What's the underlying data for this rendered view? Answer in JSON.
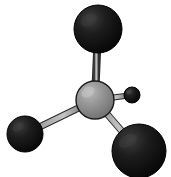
{
  "figure": {
    "kind": "molecule-diagram",
    "width": 171,
    "height": 177,
    "background_color": "#ffffff"
  },
  "palette": {
    "central_atom_fill": "#8c8c8c",
    "central_atom_highlight": "#b4b4b4",
    "central_atom_shadow": "#6e6e6e",
    "central_atom_outline": "#1a1a1a",
    "dark_atom_fill": "#141414",
    "dark_atom_highlight": "#3a3a3a",
    "dark_atom_outline": "#000000",
    "bond_fill": "#9a9a9a",
    "bond_outline": "#2b2b2b"
  },
  "atoms": [
    {
      "id": "atom-center",
      "label": "central-atom",
      "color_name": "gray",
      "cx": 95,
      "cy": 100,
      "r": 19
    },
    {
      "id": "atom-top",
      "label": "upper-atom",
      "color_name": "black",
      "cx": 98,
      "cy": 29,
      "r": 24
    },
    {
      "id": "atom-lower-left",
      "label": "lower-left-atom",
      "color_name": "black",
      "cx": 25,
      "cy": 134,
      "r": 18
    },
    {
      "id": "atom-lower-right",
      "label": "lower-right-atom",
      "color_name": "black",
      "cx": 139,
      "cy": 151,
      "r": 27
    },
    {
      "id": "atom-right-small",
      "label": "right-small-atom",
      "color_name": "black",
      "cx": 132,
      "cy": 95,
      "r": 8
    }
  ],
  "bonds": [
    {
      "id": "bond-center-top",
      "label": "bond-center-to-upper-atom",
      "from": "atom-center",
      "to": "atom-top",
      "width": 6
    },
    {
      "id": "bond-center-lower-left",
      "label": "bond-center-to-lower-left-atom",
      "from": "atom-center",
      "to": "atom-lower-left",
      "width": 6
    },
    {
      "id": "bond-center-lower-right",
      "label": "bond-center-to-lower-right-atom",
      "from": "atom-center",
      "to": "atom-lower-right",
      "width": 6
    },
    {
      "id": "bond-center-right-small",
      "label": "bond-center-to-right-small-atom",
      "from": "atom-center",
      "to": "atom-right-small",
      "width": 5
    }
  ]
}
